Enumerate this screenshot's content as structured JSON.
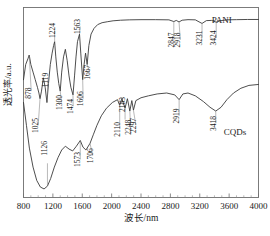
{
  "chart_data": {
    "type": "line",
    "title": "",
    "xlabel": "波长/nm",
    "ylabel": "透光率/a.u.",
    "xlim": [
      800,
      4000
    ],
    "ylim": [
      0,
      100
    ],
    "xticks": [
      800,
      1200,
      1600,
      2000,
      2400,
      2800,
      3200,
      3600,
      4000
    ],
    "yticks": [],
    "grid": false,
    "legend_position": "inline-right",
    "series": [
      {
        "name": "PANI",
        "label_x": 3500,
        "label_y": 92,
        "peaks": [
          878,
          1025,
          1119,
          1224,
          1300,
          1474,
          1563,
          1606,
          1667,
          2847,
          2918,
          3231,
          3424
        ],
        "x": [
          800,
          830,
          860,
          878,
          900,
          930,
          960,
          990,
          1010,
          1025,
          1045,
          1070,
          1095,
          1119,
          1140,
          1165,
          1190,
          1210,
          1224,
          1240,
          1260,
          1280,
          1300,
          1320,
          1345,
          1370,
          1395,
          1420,
          1445,
          1474,
          1495,
          1515,
          1535,
          1563,
          1580,
          1606,
          1625,
          1645,
          1667,
          1690,
          1720,
          1760,
          1810,
          1870,
          1940,
          2020,
          2120,
          2240,
          2400,
          2600,
          2780,
          2847,
          2880,
          2918,
          2960,
          3040,
          3140,
          3231,
          3290,
          3360,
          3424,
          3490,
          3570,
          3700,
          3850,
          4000
        ],
        "y": [
          62,
          70,
          73,
          75,
          70,
          66,
          62,
          58,
          55,
          52,
          56,
          63,
          58,
          50,
          60,
          70,
          76,
          80,
          82,
          74,
          66,
          60,
          56,
          66,
          74,
          78,
          72,
          64,
          58,
          54,
          64,
          74,
          82,
          86,
          76,
          62,
          70,
          76,
          70,
          80,
          86,
          89,
          91,
          92,
          92.5,
          93,
          93.3,
          93.5,
          93.6,
          93.6,
          93.5,
          92.6,
          93.2,
          92.4,
          93.3,
          93.6,
          93.5,
          91.6,
          93.1,
          93.2,
          92.3,
          93.1,
          93.5,
          93.6,
          93.7,
          93.7
        ]
      },
      {
        "name": "CQDs",
        "label_x": 3680,
        "label_y": 33,
        "peaks": [
          1126,
          1573,
          1706,
          2110,
          2183,
          2248,
          2297,
          2919,
          3418
        ],
        "x": [
          800,
          840,
          880,
          930,
          980,
          1030,
          1080,
          1126,
          1170,
          1220,
          1270,
          1320,
          1370,
          1420,
          1470,
          1520,
          1573,
          1610,
          1650,
          1706,
          1750,
          1800,
          1860,
          1930,
          2010,
          2080,
          2110,
          2140,
          2183,
          2215,
          2248,
          2275,
          2297,
          2330,
          2400,
          2500,
          2620,
          2750,
          2860,
          2919,
          2970,
          3040,
          3140,
          3250,
          3340,
          3418,
          3490,
          3570,
          3660,
          3760,
          3870,
          4000
        ],
        "y": [
          50,
          38,
          26,
          16,
          9,
          5.5,
          4.5,
          6,
          10,
          16,
          21,
          25,
          27,
          25.5,
          24.5,
          27,
          30,
          26.5,
          25,
          28.5,
          33,
          38,
          43,
          47,
          50,
          51.5,
          48.5,
          52,
          47,
          52,
          45.5,
          51,
          46,
          51,
          52.5,
          53.5,
          54.5,
          55,
          54,
          51.5,
          54.5,
          55,
          53.5,
          50.5,
          47.5,
          45.5,
          47.5,
          51.5,
          55,
          57.5,
          59,
          59.5
        ]
      }
    ],
    "annotations": {
      "pani_peak_labels": [
        "878",
        "1025",
        "1119",
        "1224",
        "1300",
        "1474",
        "1563",
        "1606",
        "1667",
        "2847",
        "2918",
        "3231",
        "3424"
      ],
      "cqds_peak_labels": [
        "1126",
        "1573",
        "1706",
        "2110",
        "2183",
        "2248",
        "2297",
        "2919",
        "3418"
      ]
    }
  }
}
